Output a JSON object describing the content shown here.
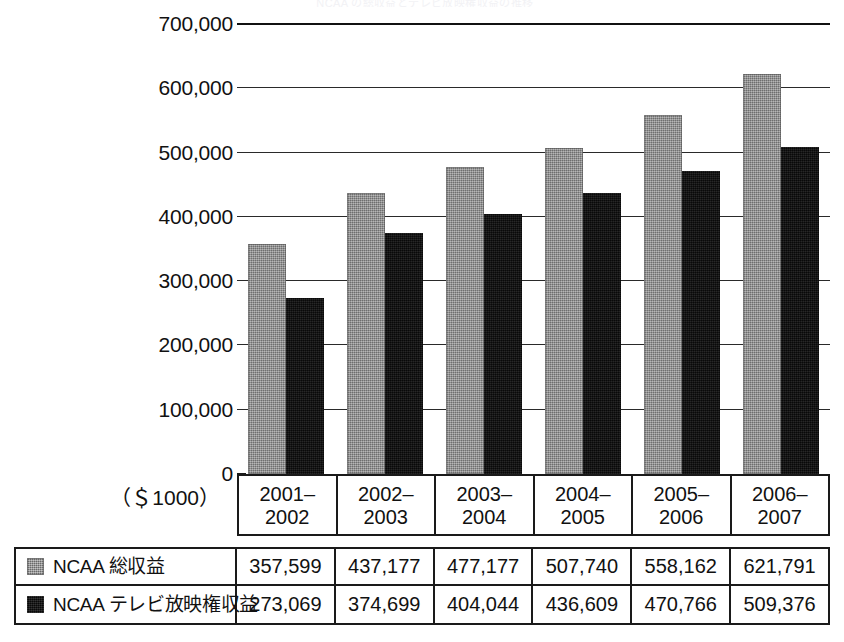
{
  "title": "NCAA の総収益とテレビ放映権収益の推移",
  "unit_label": "（＄1000）",
  "chart_data": {
    "type": "bar",
    "title": "NCAA の総収益とテレビ放映権収益の推移",
    "xlabel": "",
    "ylabel": "",
    "unit": "($1000)",
    "ylim": [
      0,
      700000
    ],
    "ytick_step": 100000,
    "yticks": [
      "0",
      "100,000",
      "200,000",
      "300,000",
      "400,000",
      "500,000",
      "600,000",
      "700,000"
    ],
    "ytick_values": [
      0,
      100000,
      200000,
      300000,
      400000,
      500000,
      600000,
      700000
    ],
    "grid": true,
    "legend_position": "bottom-table",
    "categories": [
      "2001–\n2002",
      "2002–\n2003",
      "2003–\n2004",
      "2004–\n2005",
      "2005–\n2006",
      "2006–\n2007"
    ],
    "category_lines": [
      [
        "2001–",
        "2002"
      ],
      [
        "2002–",
        "2003"
      ],
      [
        "2003–",
        "2004"
      ],
      [
        "2004–",
        "2005"
      ],
      [
        "2005–",
        "2006"
      ],
      [
        "2006–",
        "2007"
      ]
    ],
    "series": [
      {
        "name": "NCAA 総収益",
        "color": "#8b8b8b",
        "values": [
          357599,
          437177,
          477177,
          507740,
          558162,
          621791
        ],
        "labels": [
          "357,599",
          "437,177",
          "477,177",
          "507,740",
          "558,162",
          "621,791"
        ]
      },
      {
        "name": "NCAA テレビ放映権収益",
        "color": "#0e0e0e",
        "values": [
          273069,
          374699,
          404044,
          436609,
          470766,
          509376
        ],
        "labels": [
          "273,069",
          "374,699",
          "404,044",
          "436,609",
          "470,766",
          "509,376"
        ]
      }
    ]
  }
}
